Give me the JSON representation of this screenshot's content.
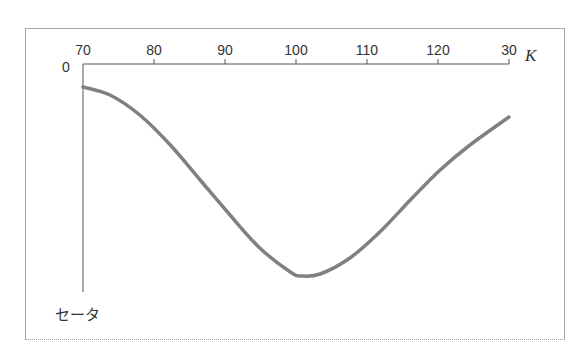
{
  "page": {
    "top_text": "",
    "frame": {
      "border_color": "#a8a8a8"
    }
  },
  "chart_data": {
    "type": "line",
    "title": "",
    "xlabel": "K",
    "ylabel": "セータ",
    "origin_label": "0",
    "x_ticks": [
      70,
      80,
      90,
      100,
      110,
      120,
      130
    ],
    "x_tick_labels": [
      "70",
      "80",
      "90",
      "100",
      "110",
      "120",
      "30"
    ],
    "xlim": [
      70,
      130
    ],
    "y_ticks": [
      0
    ],
    "y_direction": "negative-down",
    "grid": false,
    "legend": null,
    "line_color": "#808080",
    "series": [
      {
        "name": "セータ",
        "x": [
          70,
          73.8,
          78.0,
          82.3,
          86.5,
          90.7,
          94.9,
          99.2,
          100.8,
          103.4,
          107.6,
          111.8,
          116.1,
          120.3,
          124.5,
          130
        ],
        "values": [
          -23,
          -31,
          -51,
          -81,
          -116,
          -151,
          -184,
          -208,
          -212,
          -210,
          -194,
          -168,
          -136,
          -106,
          -81,
          -53
        ]
      }
    ]
  }
}
